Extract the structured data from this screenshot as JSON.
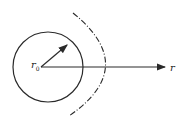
{
  "diagram": {
    "labels": {
      "center": "r",
      "center_sub": "0",
      "axis": "r"
    },
    "colors": {
      "stroke": "#2a2a2a",
      "background": "#ffffff"
    }
  }
}
